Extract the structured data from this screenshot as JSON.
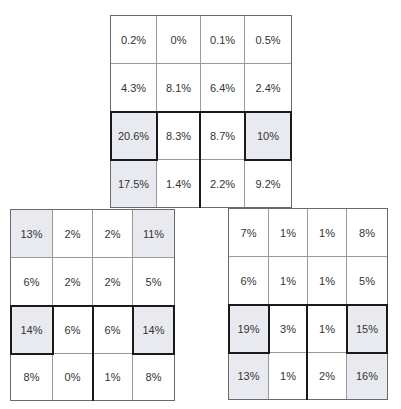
{
  "grids": {
    "top": {
      "rows": [
        [
          "0.2%",
          "0%",
          "0.1%",
          "0.5%"
        ],
        [
          "4.3%",
          "8.1%",
          "6.4%",
          "2.4%"
        ],
        [
          "20.6%",
          "8.3%",
          "8.7%",
          "10%"
        ],
        [
          "17.5%",
          "1.4%",
          "2.2%",
          "9.2%"
        ]
      ],
      "shaded": [
        [
          2,
          0
        ],
        [
          2,
          3
        ],
        [
          3,
          0
        ]
      ],
      "highlighted": [
        [
          2,
          0
        ],
        [
          2,
          3
        ]
      ]
    },
    "bottom_left": {
      "rows": [
        [
          "13%",
          "2%",
          "2%",
          "11%"
        ],
        [
          "6%",
          "2%",
          "2%",
          "5%"
        ],
        [
          "14%",
          "6%",
          "6%",
          "14%"
        ],
        [
          "8%",
          "0%",
          "1%",
          "8%"
        ]
      ],
      "shaded": [
        [
          0,
          0
        ],
        [
          0,
          3
        ],
        [
          2,
          0
        ],
        [
          2,
          3
        ]
      ],
      "highlighted": [
        [
          2,
          0
        ],
        [
          2,
          3
        ]
      ]
    },
    "bottom_right": {
      "rows": [
        [
          "7%",
          "1%",
          "1%",
          "8%"
        ],
        [
          "6%",
          "1%",
          "1%",
          "5%"
        ],
        [
          "19%",
          "3%",
          "1%",
          "15%"
        ],
        [
          "13%",
          "1%",
          "2%",
          "16%"
        ]
      ],
      "shaded": [
        [
          2,
          0
        ],
        [
          2,
          3
        ],
        [
          3,
          0
        ],
        [
          3,
          3
        ]
      ],
      "highlighted": [
        [
          2,
          0
        ],
        [
          2,
          3
        ]
      ]
    }
  },
  "colors": {
    "shaded": "#e9eaf0",
    "highlight_border": "#1a1a1a",
    "grid_line": "#9a9a9a",
    "text": "#333333"
  }
}
